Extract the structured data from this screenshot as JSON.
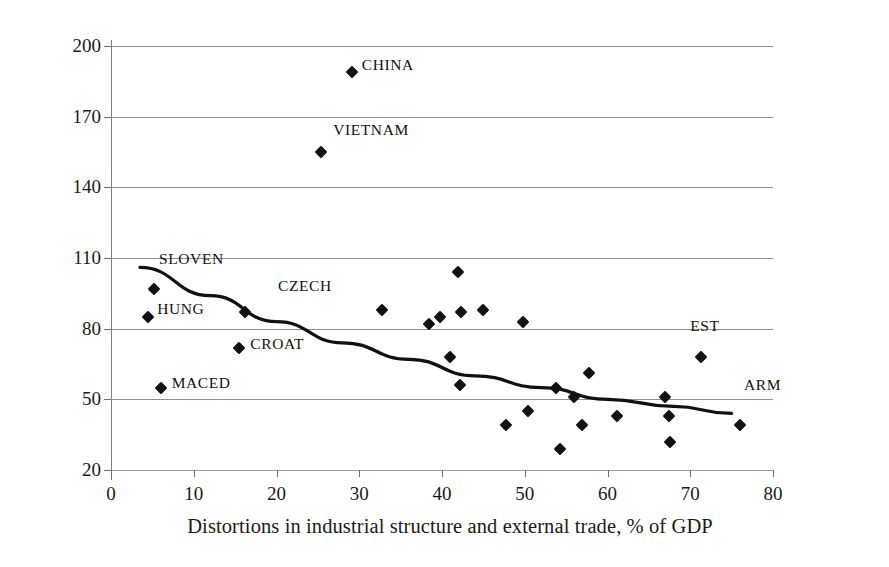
{
  "chart_data": {
    "type": "scatter",
    "title": "",
    "xlabel": "Distortions in industrial structure and external trade, % of GDP",
    "ylabel": "1996 GDP as a % of 1999 GDP",
    "xlim": [
      0,
      80
    ],
    "ylim": [
      20,
      200
    ],
    "xticks": [
      0,
      10,
      20,
      30,
      40,
      50,
      60,
      70,
      80
    ],
    "yticks": [
      20,
      50,
      80,
      110,
      140,
      170,
      200
    ],
    "grid": "horizontal",
    "legend": "none",
    "marker_style": "filled-diamond",
    "marker_color": "#111111",
    "trendline_color": "#111111",
    "points": [
      {
        "label": "HUNG",
        "x": 4.5,
        "y": 85
      },
      {
        "label": "SLOVEN",
        "x": 5.2,
        "y": 97
      },
      {
        "label": "MACED",
        "x": 6.0,
        "y": 55
      },
      {
        "label": "CROAT",
        "x": 15.5,
        "y": 72
      },
      {
        "label": "CZECH",
        "x": 16.2,
        "y": 87
      },
      {
        "label": "VIETNAM",
        "x": 25.4,
        "y": 155
      },
      {
        "label": "CHINA",
        "x": 29.1,
        "y": 189
      },
      {
        "label": "",
        "x": 32.8,
        "y": 88
      },
      {
        "label": "",
        "x": 38.4,
        "y": 82
      },
      {
        "label": "",
        "x": 39.8,
        "y": 85
      },
      {
        "label": "",
        "x": 41.0,
        "y": 68
      },
      {
        "label": "",
        "x": 41.9,
        "y": 104
      },
      {
        "label": "",
        "x": 42.3,
        "y": 87
      },
      {
        "label": "",
        "x": 42.2,
        "y": 56
      },
      {
        "label": "",
        "x": 45.0,
        "y": 88
      },
      {
        "label": "",
        "x": 47.7,
        "y": 39
      },
      {
        "label": "",
        "x": 49.8,
        "y": 83
      },
      {
        "label": "",
        "x": 50.4,
        "y": 45
      },
      {
        "label": "",
        "x": 53.8,
        "y": 55
      },
      {
        "label": "",
        "x": 54.2,
        "y": 29
      },
      {
        "label": "",
        "x": 55.9,
        "y": 51
      },
      {
        "label": "",
        "x": 56.9,
        "y": 39
      },
      {
        "label": "",
        "x": 57.8,
        "y": 61
      },
      {
        "label": "",
        "x": 61.2,
        "y": 43
      },
      {
        "label": "",
        "x": 67.0,
        "y": 51
      },
      {
        "label": "",
        "x": 67.4,
        "y": 43
      },
      {
        "label": "",
        "x": 67.6,
        "y": 32
      },
      {
        "label": "",
        "x": 71.3,
        "y": 68
      },
      {
        "label": "",
        "x": 76.0,
        "y": 39
      }
    ],
    "standalone_annotations": [
      {
        "text": "EST",
        "x": 70.0,
        "y": 81
      },
      {
        "text": "ARM",
        "x": 76.5,
        "y": 56
      }
    ],
    "trendline": {
      "description": "downward-sloping fitted curve",
      "points": [
        {
          "x": 3.5,
          "y": 106
        },
        {
          "x": 12.0,
          "y": 94
        },
        {
          "x": 20.0,
          "y": 83
        },
        {
          "x": 28.0,
          "y": 74
        },
        {
          "x": 36.0,
          "y": 67
        },
        {
          "x": 44.0,
          "y": 60
        },
        {
          "x": 52.0,
          "y": 55
        },
        {
          "x": 60.0,
          "y": 50
        },
        {
          "x": 68.0,
          "y": 47
        },
        {
          "x": 75.0,
          "y": 44
        }
      ]
    }
  },
  "axis": {
    "y_tick_labels": [
      "200",
      "170",
      "140",
      "110",
      "80",
      "50",
      "20"
    ],
    "x_tick_labels": [
      "0",
      "10",
      "20",
      "30",
      "40",
      "50",
      "60",
      "70",
      "80"
    ]
  }
}
